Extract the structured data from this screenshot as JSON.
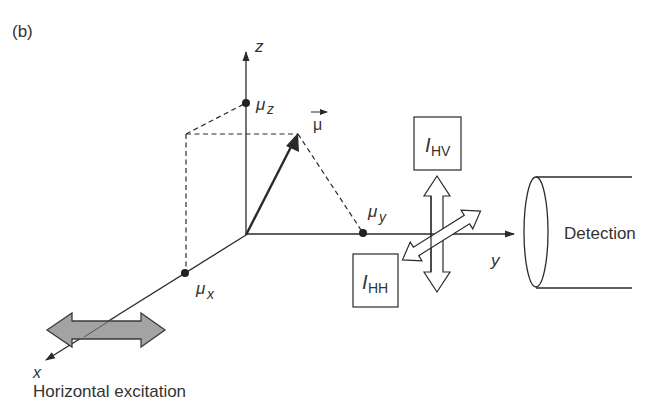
{
  "figure": {
    "panel_label": "(b)",
    "colors": {
      "stroke": "#2a2a2a",
      "text": "#333333",
      "excitation_fill": "#a3a3a3",
      "background": "#ffffff"
    }
  },
  "axes": {
    "z_label": "z",
    "y_label": "y",
    "x_label": "x"
  },
  "components": {
    "mu_z": "μ",
    "mu_z_sub": "z",
    "mu_y": "μ",
    "mu_y_sub": "y",
    "mu_x": "μ",
    "mu_x_sub": "x",
    "mu_vector": "μ"
  },
  "intensities": {
    "hv_main": "I",
    "hv_sub": "HV",
    "hh_main": "I",
    "hh_sub": "HH"
  },
  "detector": {
    "label": "Detection"
  },
  "excitation": {
    "label": "Horizontal excitation"
  }
}
